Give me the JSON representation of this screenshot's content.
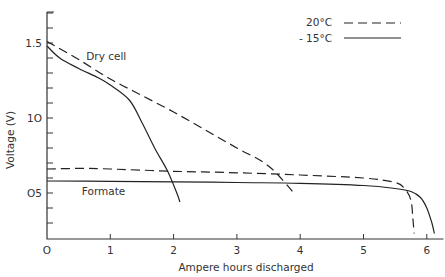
{
  "chart_data": {
    "type": "line",
    "title": "",
    "xlabel": "Ampere hours discharged",
    "ylabel": "Voltage (V)",
    "xlim": [
      0,
      6.2
    ],
    "ylim": [
      0.2,
      1.75
    ],
    "x_ticks": [
      0,
      1,
      2,
      3,
      4,
      5,
      6
    ],
    "x_tick_labels": [
      "O",
      "1",
      "2",
      "3",
      "4",
      "5",
      "6"
    ],
    "y_major_ticks": [
      0.5,
      1.0,
      1.5
    ],
    "y_tick_labels": [
      "O5",
      "1O",
      "1.5"
    ],
    "y_minor_step": 0.1,
    "grid": false,
    "legend": {
      "position": "top-right",
      "entries": [
        {
          "label": "20°C",
          "style": "dashed"
        },
        {
          "label": "- 15°C",
          "style": "solid"
        }
      ]
    },
    "annotations": [
      {
        "text": "Dry cell",
        "x": 0.62,
        "y": 1.39
      },
      {
        "text": "Formate",
        "x": 0.55,
        "y": 0.49
      }
    ],
    "series": [
      {
        "name": "Dry cell 20°C",
        "style": "dashed",
        "x": [
          0,
          0.5,
          1,
          1.5,
          2,
          2.5,
          3,
          3.5,
          3.9
        ],
        "y": [
          1.51,
          1.39,
          1.26,
          1.15,
          1.04,
          0.92,
          0.8,
          0.68,
          0.5
        ]
      },
      {
        "name": "Dry cell -15°C",
        "style": "solid",
        "x": [
          0,
          0.2,
          0.5,
          0.8,
          1.0,
          1.3,
          1.5,
          1.7,
          1.9,
          2.05,
          2.1
        ],
        "y": [
          1.48,
          1.4,
          1.33,
          1.27,
          1.22,
          1.12,
          0.97,
          0.8,
          0.65,
          0.5,
          0.44
        ]
      },
      {
        "name": "Formate 20°C",
        "style": "dashed",
        "x": [
          0,
          0.6,
          1,
          2,
          3,
          4,
          5,
          5.5,
          5.65,
          5.75,
          5.78,
          5.8
        ],
        "y": [
          0.66,
          0.665,
          0.66,
          0.645,
          0.635,
          0.62,
          0.6,
          0.57,
          0.53,
          0.45,
          0.33,
          0.23
        ]
      },
      {
        "name": "Formate -15°C",
        "style": "solid",
        "x": [
          0,
          1,
          2,
          3,
          4,
          5,
          5.5,
          5.75,
          5.9,
          6.0,
          6.08,
          6.12
        ],
        "y": [
          0.58,
          0.578,
          0.575,
          0.57,
          0.565,
          0.55,
          0.53,
          0.51,
          0.47,
          0.4,
          0.3,
          0.23
        ]
      }
    ]
  }
}
